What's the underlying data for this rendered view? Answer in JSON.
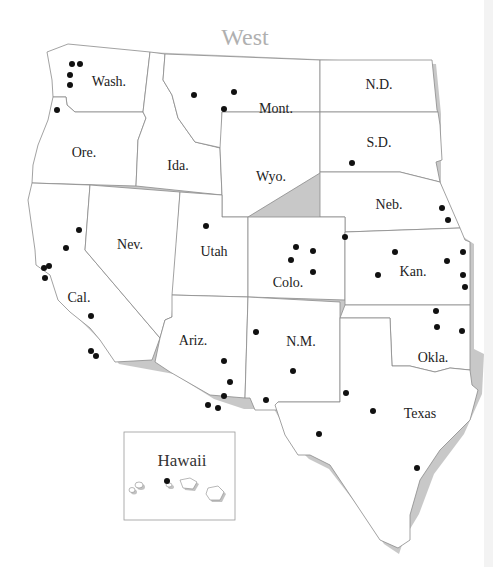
{
  "title": "West",
  "states": [
    {
      "id": "wa",
      "label": "Wash."
    },
    {
      "id": "or",
      "label": "Ore."
    },
    {
      "id": "id",
      "label": "Ida."
    },
    {
      "id": "mt",
      "label": "Mont."
    },
    {
      "id": "wy",
      "label": "Wyo."
    },
    {
      "id": "nd",
      "label": "N.D."
    },
    {
      "id": "sd",
      "label": "S.D."
    },
    {
      "id": "ne",
      "label": "Neb."
    },
    {
      "id": "ca",
      "label": "Cal."
    },
    {
      "id": "nv",
      "label": "Nev."
    },
    {
      "id": "ut",
      "label": "Utah"
    },
    {
      "id": "co",
      "label": "Colo."
    },
    {
      "id": "ks",
      "label": "Kan."
    },
    {
      "id": "az",
      "label": "Ariz."
    },
    {
      "id": "nm",
      "label": "N.M."
    },
    {
      "id": "ok",
      "label": "Okla."
    },
    {
      "id": "tx",
      "label": "Texas"
    }
  ],
  "inset": {
    "label": "Hawaii"
  },
  "markers": {
    "wa": 4,
    "or": 1,
    "mt": 3,
    "sd": 1,
    "ne": 2,
    "ca": 7,
    "ut": 1,
    "co": 5,
    "ks": 6,
    "az": 5,
    "nm": 3,
    "ok": 3,
    "tx": 4,
    "hi": 1
  },
  "colors": {
    "dot": "#111111",
    "title": "#b0b0b0",
    "border": "#8a8a8a"
  }
}
